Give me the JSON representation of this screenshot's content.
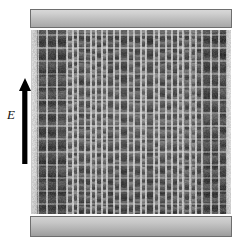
{
  "figure": {
    "background_color": "#ffffff"
  },
  "annotation": {
    "field_label": "E",
    "label_style": "italic",
    "arrow_direction": "up",
    "arrow_color": "#000000",
    "arrow_name": "electric-field-polarization-arrow"
  },
  "micrograph": {
    "top_slab": {
      "name": "top-capping-layer",
      "fill": "#c8c8c8",
      "outline": "#6e6e6e"
    },
    "bottom_slab": {
      "name": "bottom-substrate-layer",
      "fill": "#bdbdbd",
      "outline": "#6e6e6e"
    },
    "porous_region": {
      "name": "macroporous-silicon-lattice",
      "base_fill": "#8e8e8e",
      "left_edge_fill": "#e2e2e2",
      "right_edge_fill": "#e4e4e4"
    },
    "columns": [
      {
        "x": 6,
        "w": 9,
        "tone": "#5a5a5a",
        "pore_h": 13,
        "pore_w": 7,
        "bright": 0.3
      },
      {
        "x": 15,
        "w": 10,
        "tone": "#4f4f4f",
        "pore_h": 13,
        "pore_w": 8,
        "bright": 0.26
      },
      {
        "x": 25,
        "w": 10,
        "tone": "#565656",
        "pore_h": 13,
        "pore_w": 8,
        "bright": 0.32
      },
      {
        "x": 35,
        "w": 6,
        "tone": "#9a9a9a",
        "pore_h": 7,
        "pore_w": 4,
        "bright": 0.55
      },
      {
        "x": 41,
        "w": 5,
        "tone": "#8f8f8f",
        "pore_h": 7,
        "pore_w": 3,
        "bright": 0.5
      },
      {
        "x": 46,
        "w": 7,
        "tone": "#6d6d6d",
        "pore_h": 9,
        "pore_w": 5,
        "bright": 0.38
      },
      {
        "x": 53,
        "w": 6,
        "tone": "#7b7b7b",
        "pore_h": 9,
        "pore_w": 4,
        "bright": 0.44
      },
      {
        "x": 59,
        "w": 5,
        "tone": "#8b8b8b",
        "pore_h": 6,
        "pore_w": 3,
        "bright": 0.52
      },
      {
        "x": 64,
        "w": 6,
        "tone": "#757575",
        "pore_h": 7,
        "pore_w": 4,
        "bright": 0.42
      },
      {
        "x": 70,
        "w": 5,
        "tone": "#8a8a8a",
        "pore_h": 6,
        "pore_w": 3,
        "bright": 0.54
      },
      {
        "x": 75,
        "w": 7,
        "tone": "#6a6a6a",
        "pore_h": 9,
        "pore_w": 5,
        "bright": 0.36
      },
      {
        "x": 82,
        "w": 6,
        "tone": "#7f7f7f",
        "pore_h": 8,
        "pore_w": 4,
        "bright": 0.46
      },
      {
        "x": 88,
        "w": 8,
        "tone": "#5f5f5f",
        "pore_h": 11,
        "pore_w": 6,
        "bright": 0.3
      },
      {
        "x": 96,
        "w": 6,
        "tone": "#828282",
        "pore_h": 8,
        "pore_w": 4,
        "bright": 0.48
      },
      {
        "x": 102,
        "w": 7,
        "tone": "#6f6f6f",
        "pore_h": 10,
        "pore_w": 5,
        "bright": 0.38
      },
      {
        "x": 109,
        "w": 5,
        "tone": "#909090",
        "pore_h": 6,
        "pore_w": 3,
        "bright": 0.56
      },
      {
        "x": 114,
        "w": 8,
        "tone": "#626262",
        "pore_h": 12,
        "pore_w": 6,
        "bright": 0.28
      },
      {
        "x": 122,
        "w": 5,
        "tone": "#8d8d8d",
        "pore_h": 7,
        "pore_w": 3,
        "bright": 0.52
      },
      {
        "x": 127,
        "w": 7,
        "tone": "#717171",
        "pore_h": 9,
        "pore_w": 5,
        "bright": 0.4
      },
      {
        "x": 134,
        "w": 6,
        "tone": "#7d7d7d",
        "pore_h": 8,
        "pore_w": 4,
        "bright": 0.46
      },
      {
        "x": 140,
        "w": 6,
        "tone": "#6b6b6b",
        "pore_h": 9,
        "pore_w": 4,
        "bright": 0.36
      },
      {
        "x": 146,
        "w": 5,
        "tone": "#949494",
        "pore_h": 6,
        "pore_w": 3,
        "bright": 0.58
      },
      {
        "x": 151,
        "w": 7,
        "tone": "#767676",
        "pore_h": 8,
        "pore_w": 4,
        "bright": 0.44
      },
      {
        "x": 158,
        "w": 6,
        "tone": "#868686",
        "pore_h": 6,
        "pore_w": 3,
        "bright": 0.6
      },
      {
        "x": 164,
        "w": 6,
        "tone": "#6e6e6e",
        "pore_h": 9,
        "pore_w": 4,
        "bright": 0.38
      },
      {
        "x": 170,
        "w": 9,
        "tone": "#5c5c5c",
        "pore_h": 12,
        "pore_w": 6,
        "bright": 0.3
      },
      {
        "x": 179,
        "w": 8,
        "tone": "#666666",
        "pore_h": 12,
        "pore_w": 6,
        "bright": 0.32
      },
      {
        "x": 187,
        "w": 8,
        "tone": "#5a5a5a",
        "pore_h": 13,
        "pore_w": 6,
        "bright": 0.27
      }
    ],
    "lattice": {
      "vertical_period_px": 13,
      "rung_color": "#d9d9d9",
      "pore_dark": "#3c3c3c"
    }
  }
}
